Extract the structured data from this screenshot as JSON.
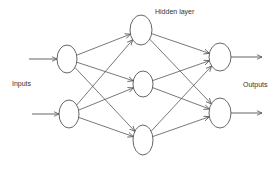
{
  "diagram": {
    "labels": {
      "inputs": "Inputs",
      "hidden": "Hidden layer",
      "outputs": "Outputs"
    },
    "layers": [
      {
        "name": "input",
        "nodes": [
          {
            "cx": 67,
            "cy": 59,
            "rx": 10,
            "ry": 14
          },
          {
            "cx": 69,
            "cy": 114,
            "rx": 10,
            "ry": 14
          }
        ]
      },
      {
        "name": "hidden",
        "nodes": [
          {
            "cx": 141,
            "cy": 30,
            "rx": 11,
            "ry": 15
          },
          {
            "cx": 143,
            "cy": 84,
            "rx": 10,
            "ry": 13
          },
          {
            "cx": 143,
            "cy": 140,
            "rx": 10,
            "ry": 15
          }
        ]
      },
      {
        "name": "output",
        "nodes": [
          {
            "cx": 220,
            "cy": 57,
            "rx": 11,
            "ry": 14
          },
          {
            "cx": 220,
            "cy": 113,
            "rx": 11,
            "ry": 15
          }
        ]
      }
    ],
    "connections": "fully-connected",
    "colors": {
      "stroke": "#555555",
      "text": "#333333",
      "background": "#ffffff"
    }
  }
}
